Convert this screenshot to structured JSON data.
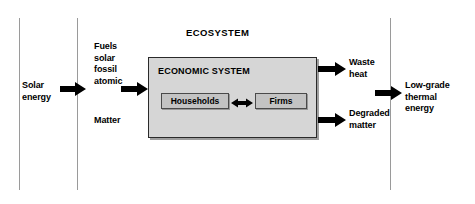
{
  "diagram": {
    "ecosystem_label": "ECOSYSTEM",
    "economic_system_label": "ECONOMIC SYSTEM",
    "inner_nodes": [
      {
        "id": "households",
        "label": "Households"
      },
      {
        "id": "firms",
        "label": "Firms"
      }
    ],
    "inputs": [
      {
        "id": "solar-energy",
        "label": "Solar\nenergy"
      },
      {
        "id": "fuels",
        "label": "Fuels\nsolar\nfossil\natomic"
      },
      {
        "id": "matter",
        "label": "Matter"
      }
    ],
    "outputs": [
      {
        "id": "waste-heat",
        "label": "Waste\nheat"
      },
      {
        "id": "degraded-matter",
        "label": "Degraded\nmatter"
      },
      {
        "id": "low-grade-thermal-energy",
        "label": "Low-grade\nthermal\nenergy"
      }
    ],
    "colors": {
      "arrow": "#000000",
      "boundary_line": "#9a9a9a",
      "economic_box_fill": "#d6d6d6",
      "inner_box_fill": "#c3c3c3",
      "box_border": "#2a2a2a",
      "background": "#ffffff",
      "text": "#000000"
    },
    "boundaries": [
      {
        "id": "outer-left-boundary"
      },
      {
        "id": "ecosystem-left-boundary"
      },
      {
        "id": "ecosystem-right-boundary"
      }
    ]
  }
}
